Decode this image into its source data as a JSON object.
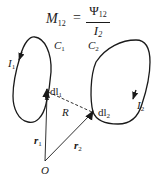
{
  "formula": {
    "lhs": "M",
    "lhs_sub": "12",
    "equals": "=",
    "numerator": "Ψ",
    "numerator_sub": "12",
    "denominator": "I",
    "denominator_sub": "2"
  },
  "labels": {
    "I1": {
      "main": "I",
      "sub": "1"
    },
    "C1": {
      "main": "C",
      "sub": "1"
    },
    "C2": {
      "main": "C",
      "sub": "2"
    },
    "I2": {
      "main": "I",
      "sub": "2"
    },
    "dl1": {
      "main": "dl",
      "sub": "1"
    },
    "dl2": {
      "main": "dl",
      "sub": "2"
    },
    "R": {
      "main": "R"
    },
    "r1": {
      "main": "r",
      "sub": "1"
    },
    "r2": {
      "main": "r",
      "sub": "2"
    },
    "O": {
      "main": "O"
    }
  },
  "colors": {
    "stroke": "#1a1a1a",
    "background": "#ffffff"
  }
}
